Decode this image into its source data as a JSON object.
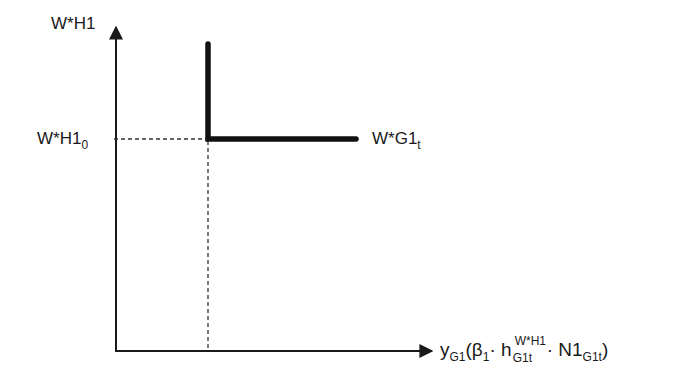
{
  "diagram": {
    "y_axis_label": "W*H1",
    "reference_level_label": {
      "main": "W*H1",
      "sub": "0"
    },
    "curve_label": {
      "main": "W*G1",
      "sub": "t"
    },
    "x_axis_label": {
      "y": "y",
      "y_sub": "G1",
      "open": "(",
      "beta": "β",
      "beta_sub": "1",
      "dot1": "·",
      "h": "h",
      "h_sup": "W*H1",
      "h_sub": "G1t",
      "dot2": "·",
      "n": "N1",
      "n_sub": "G1t",
      "close": ")"
    },
    "colors": {
      "line": "#111111",
      "axis": "#1a1a1a",
      "dashed": "#333333",
      "background": "#ffffff"
    },
    "elements": {
      "y_axis": {
        "x": 116,
        "y_top": 25,
        "y_bottom": 351
      },
      "x_axis": {
        "y": 351,
        "x_left": 116,
        "x_right": 432
      },
      "curve_vertical": {
        "x": 208,
        "y_top": 42,
        "y_bottom": 139
      },
      "curve_horizontal": {
        "y": 139,
        "x_left": 208,
        "x_right": 357
      },
      "dashed_horizontal": {
        "y": 139,
        "x_left": 114,
        "x_right": 208
      },
      "dashed_vertical": {
        "x": 208,
        "y_top": 139,
        "y_bottom": 351
      }
    }
  }
}
